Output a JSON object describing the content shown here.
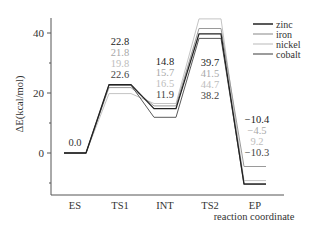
{
  "chart_data": {
    "type": "line",
    "title": "",
    "xlabel": "reaction coordinate",
    "ylabel": "ΔE(kcal/mol)",
    "categories": [
      "ES",
      "TS1",
      "INT",
      "TS2",
      "EP"
    ],
    "yticks": [
      0,
      20,
      40
    ],
    "ylim": [
      -14,
      46
    ],
    "grid": false,
    "legend_position": "upper right",
    "series": [
      {
        "name": "zinc",
        "color": "#222222",
        "width": 1.3,
        "values": [
          0.0,
          22.8,
          14.8,
          39.7,
          -10.4
        ]
      },
      {
        "name": "iron",
        "color": "#9a9a9a",
        "width": 1.0,
        "values": [
          0.0,
          21.8,
          15.7,
          41.5,
          -4.5
        ]
      },
      {
        "name": "nickel",
        "color": "#c4c4c4",
        "width": 1.0,
        "values": [
          0.0,
          19.8,
          16.5,
          44.7,
          -9.2
        ]
      },
      {
        "name": "cobalt",
        "color": "#5a5a5a",
        "width": 1.0,
        "values": [
          0.0,
          22.6,
          11.9,
          38.2,
          -10.3
        ]
      }
    ],
    "annotations": {
      "ES": [
        "0.0"
      ],
      "TS1": [
        "22.8",
        "21.8",
        "19.8",
        "22.6"
      ],
      "INT": [
        "14.8",
        "15.7",
        "16.5",
        "11.9"
      ],
      "TS2": [
        "39.7",
        "41.5",
        "44.7",
        "38.2"
      ],
      "EP": [
        "−10.4",
        "−4.5",
        "9.2",
        "−10.3"
      ]
    }
  }
}
